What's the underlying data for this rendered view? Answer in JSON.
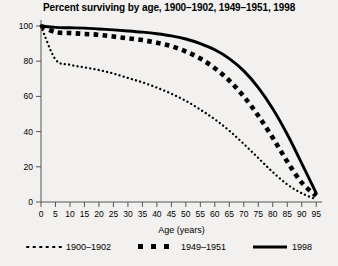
{
  "chart_data": {
    "type": "line",
    "title": "Percent surviving by age, 1900–1902, 1949–1951, 1998",
    "xlabel": "Age (years)",
    "ylabel": "",
    "xlim": [
      0,
      97
    ],
    "ylim": [
      0,
      100
    ],
    "grid": false,
    "legend_position": "bottom",
    "xticks": [
      0,
      5,
      10,
      15,
      20,
      25,
      30,
      35,
      40,
      45,
      50,
      55,
      60,
      65,
      70,
      75,
      80,
      85,
      90,
      95
    ],
    "xtick_labels": [
      "0",
      "5",
      "10",
      "15",
      "20",
      "25",
      "30",
      "35",
      "40",
      "45",
      "50",
      "55",
      "60",
      "65",
      "70",
      "75",
      "80",
      "85",
      "90",
      "95"
    ],
    "yticks": [
      0,
      20,
      40,
      60,
      80,
      100
    ],
    "ytick_labels": [
      "0",
      "20",
      "40",
      "60",
      "80",
      "100"
    ],
    "x": [
      0,
      5,
      10,
      15,
      20,
      25,
      30,
      35,
      40,
      45,
      50,
      55,
      60,
      65,
      70,
      75,
      80,
      85,
      90,
      95
    ],
    "series": [
      {
        "name": "1900–1902",
        "style": "dotted",
        "color": "#000000",
        "values": [
          100,
          81,
          78,
          76.5,
          75,
          73,
          70.5,
          68,
          65,
          61.5,
          57.5,
          52.5,
          47,
          40.5,
          33,
          25,
          17,
          10,
          5,
          1.5
        ]
      },
      {
        "name": "1949–1951",
        "style": "dashed-square",
        "color": "#000000",
        "values": [
          100,
          96.5,
          96,
          95.5,
          95,
          94,
          93,
          92,
          90.5,
          88.5,
          85.5,
          81.5,
          76,
          69,
          60,
          49,
          36.5,
          23,
          11,
          3.5
        ]
      },
      {
        "name": "1998",
        "style": "solid",
        "color": "#000000",
        "values": [
          100,
          99.2,
          99,
          98.8,
          98.3,
          97.8,
          97.2,
          96.5,
          95.6,
          94.4,
          92.6,
          90,
          86.5,
          81.5,
          74.5,
          65,
          53,
          38.5,
          22,
          5
        ]
      }
    ]
  },
  "legend": {
    "entries": [
      {
        "label": "1900–1902",
        "marker": "dotted-line-swatch"
      },
      {
        "label": "1949–1951",
        "marker": "dashed-square-swatch"
      },
      {
        "label": "1998",
        "marker": "solid-line-swatch"
      }
    ]
  }
}
